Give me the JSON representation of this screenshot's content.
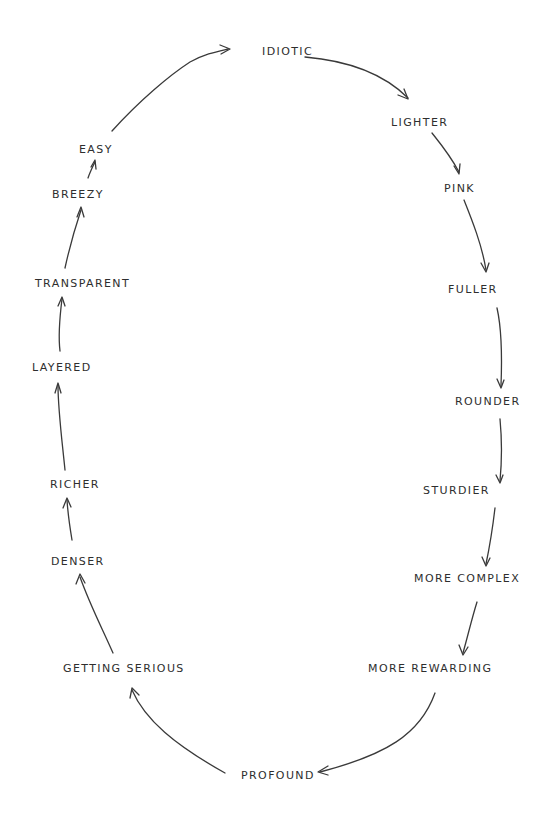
{
  "diagram": {
    "type": "cycle",
    "style": "hand-drawn",
    "ink_color": "#3a3a3a",
    "background": "#ffffff",
    "nodes": [
      {
        "id": "idiotic",
        "label": "IDIOTIC",
        "x": 262,
        "y": 51
      },
      {
        "id": "lighter",
        "label": "LIGHTER",
        "x": 391,
        "y": 122
      },
      {
        "id": "pink",
        "label": "PINK",
        "x": 444,
        "y": 188
      },
      {
        "id": "fuller",
        "label": "FULLER",
        "x": 448,
        "y": 289
      },
      {
        "id": "rounder",
        "label": "ROUNDER",
        "x": 455,
        "y": 401
      },
      {
        "id": "sturdier",
        "label": "STURDIER",
        "x": 423,
        "y": 490
      },
      {
        "id": "more_complex",
        "label": "MORE COMPLEX",
        "x": 414,
        "y": 578
      },
      {
        "id": "more_rewarding",
        "label": "MORE REWARDING",
        "x": 368,
        "y": 668
      },
      {
        "id": "profound",
        "label": "PROFOUND",
        "x": 241,
        "y": 775
      },
      {
        "id": "getting_serious",
        "label": "GETTING SERIOUS",
        "x": 63,
        "y": 668
      },
      {
        "id": "denser",
        "label": "DENSER",
        "x": 51,
        "y": 561
      },
      {
        "id": "richer",
        "label": "RICHER",
        "x": 50,
        "y": 484
      },
      {
        "id": "layered",
        "label": "LAYERED",
        "x": 32,
        "y": 367
      },
      {
        "id": "transparent",
        "label": "TRANSPARENT",
        "x": 35,
        "y": 283
      },
      {
        "id": "breezy",
        "label": "BREEZY",
        "x": 52,
        "y": 194
      },
      {
        "id": "easy",
        "label": "EASY",
        "x": 79,
        "y": 149
      }
    ],
    "edges": [
      {
        "from": "idiotic",
        "to": "lighter",
        "path": "M305,57 C340,60 380,70 408,98",
        "head": "M398,95 L408,99 L404,89"
      },
      {
        "from": "lighter",
        "to": "pink",
        "path": "M432,133 C440,143 450,155 459,172",
        "head": "M454,166 L459,174 L460,164"
      },
      {
        "from": "pink",
        "to": "fuller",
        "path": "M464,200 C472,220 482,245 486,270",
        "head": "M481,263 L486,272 L489,263"
      },
      {
        "from": "fuller",
        "to": "rounder",
        "path": "M497,308 C502,330 502,360 501,386",
        "head": "M497,379 L501,388 L504,380"
      },
      {
        "from": "rounder",
        "to": "sturdier",
        "path": "M500,419 C502,440 502,460 500,481",
        "head": "M496,475 L500,483 L503,475"
      },
      {
        "from": "sturdier",
        "to": "more_complex",
        "path": "M495,508 C493,525 490,545 486,564",
        "head": "M482,557 L486,566 L490,558"
      },
      {
        "from": "more_complex",
        "to": "more_rewarding",
        "path": "M477,602 C472,618 468,635 463,653",
        "head": "M459,645 L463,655 L468,647"
      },
      {
        "from": "more_rewarding",
        "to": "profound",
        "path": "M435,693 C420,735 385,755 320,772",
        "head": "M328,766 L318,772 L328,775"
      },
      {
        "from": "profound",
        "to": "getting_serious",
        "path": "M225,773 C175,745 145,720 132,690",
        "head": "M130,698 L132,688 L139,695"
      },
      {
        "from": "getting_serious",
        "to": "denser",
        "path": "M113,653 C102,628 90,605 80,577",
        "head": "M76,584 L80,574 L85,583"
      },
      {
        "from": "denser",
        "to": "richer",
        "path": "M72,540 C70,528 68,515 67,500",
        "head": "M63,508 L67,498 L71,507"
      },
      {
        "from": "richer",
        "to": "layered",
        "path": "M65,470 C62,440 58,410 58,385",
        "head": "M55,393 L58,383 L61,393"
      },
      {
        "from": "layered",
        "to": "transparent",
        "path": "M60,351 C58,335 60,315 62,299",
        "head": "M58,306 L62,297 L65,306"
      },
      {
        "from": "transparent",
        "to": "breezy",
        "path": "M65,268 C70,245 76,225 81,210",
        "head": "M77,217 L81,207 L84,217"
      },
      {
        "from": "breezy",
        "to": "easy",
        "path": "M88,178 C90,172 92,168 95,162",
        "head": "M91,167 L95,160 L96,169"
      },
      {
        "from": "easy",
        "to": "idiotic",
        "path": "M112,131 C140,100 170,75 190,62 C205,54 215,52 228,49",
        "head": "M220,45 L230,49 L221,54"
      }
    ]
  }
}
